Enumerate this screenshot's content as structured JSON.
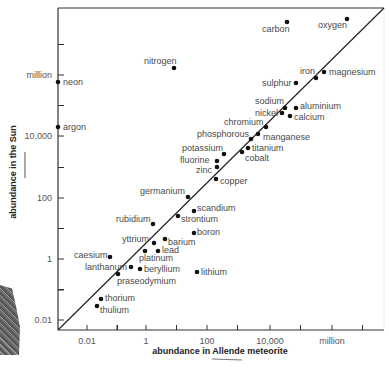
{
  "chart_data": {
    "type": "scatter",
    "title": "",
    "xlabel": "abundance in Allende meteorite",
    "ylabel": "abundance in the Sun",
    "x_scale": "log",
    "y_scale": "log",
    "x_tick_labels": [
      "0.01",
      "1",
      "100",
      "10,000",
      "million"
    ],
    "y_tick_labels": [
      "0.01",
      "1",
      "100",
      "10,000",
      "million"
    ],
    "grid": false,
    "legend": null,
    "reference_line": "y = x diagonal",
    "points": [
      {
        "name": "oxygen",
        "px": 347,
        "py": 19,
        "lx": 318,
        "ly": 28,
        "anchor": "start"
      },
      {
        "name": "carbon",
        "px": 287,
        "py": 22,
        "lx": 262,
        "ly": 32,
        "anchor": "start"
      },
      {
        "name": "nitrogen",
        "px": 174,
        "py": 68,
        "lx": 144,
        "ly": 64,
        "anchor": "start"
      },
      {
        "name": "neon",
        "px": 58,
        "py": 82,
        "lx": 63,
        "ly": 85,
        "anchor": "start"
      },
      {
        "name": "argon",
        "px": 58,
        "py": 127,
        "lx": 63,
        "ly": 130,
        "anchor": "start"
      },
      {
        "name": "magnesium",
        "px": 324,
        "py": 72,
        "lx": 329,
        "ly": 75,
        "anchor": "start"
      },
      {
        "name": "iron",
        "px": 316,
        "py": 78,
        "lx": 300,
        "ly": 74,
        "anchor": "start"
      },
      {
        "name": "sulphur",
        "px": 296,
        "py": 83,
        "lx": 262,
        "ly": 86,
        "anchor": "start"
      },
      {
        "name": "sodium",
        "px": 285,
        "py": 108,
        "lx": 255,
        "ly": 104,
        "anchor": "start"
      },
      {
        "name": "aluminium",
        "px": 296,
        "py": 108,
        "lx": 300,
        "ly": 109,
        "anchor": "start"
      },
      {
        "name": "nickel",
        "px": 282,
        "py": 113,
        "lx": 255,
        "ly": 116,
        "anchor": "start"
      },
      {
        "name": "calcium",
        "px": 290,
        "py": 116,
        "lx": 294,
        "ly": 120,
        "anchor": "start"
      },
      {
        "name": "chromium",
        "px": 266,
        "py": 127,
        "lx": 224,
        "ly": 125,
        "anchor": "start"
      },
      {
        "name": "manganese",
        "px": 258,
        "py": 134,
        "lx": 263,
        "ly": 140,
        "anchor": "start"
      },
      {
        "name": "phosphorous",
        "px": 251,
        "py": 139,
        "lx": 197,
        "ly": 137,
        "anchor": "start"
      },
      {
        "name": "titanium",
        "px": 248,
        "py": 148,
        "lx": 252,
        "ly": 151,
        "anchor": "start"
      },
      {
        "name": "potassium",
        "px": 224,
        "py": 154,
        "lx": 182,
        "ly": 151,
        "anchor": "start"
      },
      {
        "name": "cobalt",
        "px": 242,
        "py": 152,
        "lx": 245,
        "ly": 161,
        "anchor": "start"
      },
      {
        "name": "fluorine",
        "px": 217,
        "py": 161,
        "lx": 180,
        "ly": 163,
        "anchor": "start"
      },
      {
        "name": "zinc",
        "px": 217,
        "py": 167,
        "lx": 196,
        "ly": 173,
        "anchor": "start"
      },
      {
        "name": "copper",
        "px": 216,
        "py": 179,
        "lx": 220,
        "ly": 184,
        "anchor": "start"
      },
      {
        "name": "germanium",
        "px": 188,
        "py": 197,
        "lx": 140,
        "ly": 194,
        "anchor": "start"
      },
      {
        "name": "scandium",
        "px": 194,
        "py": 211,
        "lx": 197,
        "ly": 211,
        "anchor": "start"
      },
      {
        "name": "strontium",
        "px": 178,
        "py": 216,
        "lx": 181,
        "ly": 222,
        "anchor": "start"
      },
      {
        "name": "rubidium",
        "px": 153,
        "py": 224,
        "lx": 116,
        "ly": 222,
        "anchor": "start"
      },
      {
        "name": "boron",
        "px": 194,
        "py": 233,
        "lx": 197,
        "ly": 235,
        "anchor": "start"
      },
      {
        "name": "yttrium",
        "px": 154,
        "py": 243,
        "lx": 122,
        "ly": 242,
        "anchor": "start"
      },
      {
        "name": "barium",
        "px": 165,
        "py": 239,
        "lx": 168,
        "ly": 245,
        "anchor": "start"
      },
      {
        "name": "platinum",
        "px": 145,
        "py": 251,
        "lx": 139,
        "ly": 261,
        "anchor": "start"
      },
      {
        "name": "lead",
        "px": 158,
        "py": 251,
        "lx": 162,
        "ly": 253,
        "anchor": "start"
      },
      {
        "name": "caesium",
        "px": 110,
        "py": 257,
        "lx": 74,
        "ly": 258,
        "anchor": "start"
      },
      {
        "name": "lanthanum",
        "px": 131,
        "py": 267,
        "lx": 85,
        "ly": 270,
        "anchor": "start"
      },
      {
        "name": "beryllium",
        "px": 140,
        "py": 269,
        "lx": 144,
        "ly": 272,
        "anchor": "start"
      },
      {
        "name": "lithium",
        "px": 197,
        "py": 272,
        "lx": 201,
        "ly": 275,
        "anchor": "start"
      },
      {
        "name": "praseodymium",
        "px": 118,
        "py": 274,
        "lx": 117,
        "ly": 284,
        "anchor": "start"
      },
      {
        "name": "thorium",
        "px": 101,
        "py": 299,
        "lx": 105,
        "ly": 301,
        "anchor": "start"
      },
      {
        "name": "thulium",
        "px": 97,
        "py": 306,
        "lx": 100,
        "ly": 313,
        "anchor": "start"
      }
    ],
    "values_log10": [
      {
        "name": "oxygen",
        "x": 6.4,
        "y": 8.5
      },
      {
        "name": "carbon",
        "x": 4.4,
        "y": 8.4
      },
      {
        "name": "nitrogen",
        "x": 0.6,
        "y": 6.9
      },
      {
        "name": "neon",
        "x": -3.0,
        "y": 6.5
      },
      {
        "name": "argon",
        "x": -3.0,
        "y": 5.0
      },
      {
        "name": "magnesium",
        "x": 6.0,
        "y": 6.0
      },
      {
        "name": "iron",
        "x": 5.8,
        "y": 5.8
      },
      {
        "name": "sulphur",
        "x": 5.1,
        "y": 5.6
      },
      {
        "name": "sodium",
        "x": 4.8,
        "y": 4.8
      },
      {
        "name": "aluminium",
        "x": 5.1,
        "y": 4.8
      },
      {
        "name": "nickel",
        "x": 4.7,
        "y": 4.6
      },
      {
        "name": "calcium",
        "x": 4.9,
        "y": 4.5
      },
      {
        "name": "chromium",
        "x": 4.1,
        "y": 4.3
      },
      {
        "name": "manganese",
        "x": 3.9,
        "y": 4.0
      },
      {
        "name": "phosphorous",
        "x": 3.7,
        "y": 3.9
      },
      {
        "name": "titanium",
        "x": 3.6,
        "y": 3.6
      },
      {
        "name": "potassium",
        "x": 2.8,
        "y": 3.4
      },
      {
        "name": "cobalt",
        "x": 3.4,
        "y": 3.5
      },
      {
        "name": "fluorine",
        "x": 2.6,
        "y": 3.2
      },
      {
        "name": "zinc",
        "x": 2.6,
        "y": 3.0
      },
      {
        "name": "copper",
        "x": 2.6,
        "y": 2.6
      },
      {
        "name": "germanium",
        "x": 1.7,
        "y": 2.0
      },
      {
        "name": "scandium",
        "x": 1.9,
        "y": 1.6
      },
      {
        "name": "strontium",
        "x": 1.4,
        "y": 1.4
      },
      {
        "name": "rubidium",
        "x": 0.5,
        "y": 1.1
      },
      {
        "name": "boron",
        "x": 1.9,
        "y": 0.9
      },
      {
        "name": "yttrium",
        "x": 0.6,
        "y": 0.6
      },
      {
        "name": "barium",
        "x": 0.9,
        "y": 0.7
      },
      {
        "name": "platinum",
        "x": 0.3,
        "y": 0.3
      },
      {
        "name": "lead",
        "x": 0.7,
        "y": 0.3
      },
      {
        "name": "caesium",
        "x": -1.1,
        "y": 0.1
      },
      {
        "name": "lanthanum",
        "x": -0.4,
        "y": -0.3
      },
      {
        "name": "beryllium",
        "x": -0.1,
        "y": -0.4
      },
      {
        "name": "lithium",
        "x": 1.9,
        "y": -0.5
      },
      {
        "name": "praseodymium",
        "x": -0.8,
        "y": -0.6
      },
      {
        "name": "thorium",
        "x": -1.4,
        "y": -1.4
      },
      {
        "name": "thulium",
        "x": -1.5,
        "y": -1.6
      }
    ]
  },
  "axes": {
    "x_title": "abundance in Allende meteorite",
    "y_title": "abundance in the Sun",
    "x_ticks": [
      {
        "label": "0.01",
        "x": 87
      },
      {
        "label": "1",
        "x": 146
      },
      {
        "label": "100",
        "x": 207
      },
      {
        "label": "10,000",
        "x": 270
      },
      {
        "label": "million",
        "x": 332
      }
    ],
    "y_ticks": [
      {
        "label": "million",
        "y": 75
      },
      {
        "label": "10,000",
        "y": 136
      },
      {
        "label": "100",
        "y": 198
      },
      {
        "label": "1",
        "y": 259
      },
      {
        "label": "0.01",
        "y": 320
      }
    ]
  }
}
